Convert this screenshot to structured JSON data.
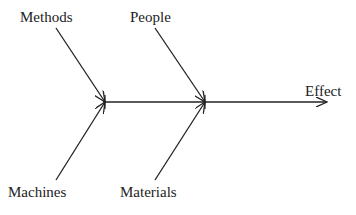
{
  "diagram": {
    "type": "fishbone",
    "effect": "Effect",
    "causes": {
      "top": [
        "Methods",
        "People"
      ],
      "bottom": [
        "Machines",
        "Materials"
      ]
    },
    "colors": {
      "line": "#222222",
      "text": "#222222",
      "background": "#ffffff"
    }
  }
}
